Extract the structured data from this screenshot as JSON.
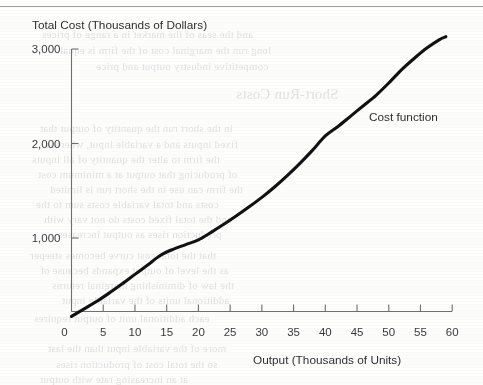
{
  "figure": {
    "background_color": "#fdfdfc",
    "ink_color": "#111114",
    "axis_color": "#6e6e74"
  },
  "bleed_through": [
    {
      "text": "and the seas of the market in a range of prices",
      "x": 42,
      "y": 28,
      "size": 11
    },
    {
      "text": "long run the marginal cost of the firm is equal",
      "x": 60,
      "y": 44,
      "size": 11
    },
    {
      "text": "competitive industry output and price",
      "x": 96,
      "y": 60,
      "size": 11
    },
    {
      "text": "Short-Run Costs",
      "x": 236,
      "y": 86,
      "size": 15
    },
    {
      "text": "in the short run the quantity of output that",
      "x": 40,
      "y": 122,
      "size": 11
    },
    {
      "text": "fixed inputs and a variable input, whereas",
      "x": 46,
      "y": 138,
      "size": 11
    },
    {
      "text": "the firm to alter the quantity of all inputs",
      "x": 32,
      "y": 153,
      "size": 11
    },
    {
      "text": "of producing that output at a minimum cost",
      "x": 38,
      "y": 168,
      "size": 11
    },
    {
      "text": "the firm can use in the short run is limited",
      "x": 50,
      "y": 183,
      "size": 11
    },
    {
      "text": "costs and total variable costs sum to the",
      "x": 36,
      "y": 198,
      "size": 11
    },
    {
      "text": "and the total fixed costs do not vary with",
      "x": 44,
      "y": 213,
      "size": 11
    },
    {
      "text": "production rises as output increases",
      "x": 58,
      "y": 228,
      "size": 11
    },
    {
      "text": "that the total cost curve becomes steeper",
      "x": 30,
      "y": 249,
      "size": 11
    },
    {
      "text": "as the level of output expands because of",
      "x": 40,
      "y": 264,
      "size": 11
    },
    {
      "text": "the law of diminishing marginal returns",
      "x": 52,
      "y": 279,
      "size": 11
    },
    {
      "text": "additional units of the variable input",
      "x": 62,
      "y": 294,
      "size": 11
    },
    {
      "text": "each additional unit of output requires",
      "x": 34,
      "y": 312,
      "size": 11
    },
    {
      "text": "more of the variable input than the last",
      "x": 48,
      "y": 342,
      "size": 11
    },
    {
      "text": "so the total cost of production rises",
      "x": 56,
      "y": 358,
      "size": 11
    },
    {
      "text": "at an increasing rate with output",
      "x": 40,
      "y": 373,
      "size": 11
    }
  ],
  "chart_data": {
    "type": "line",
    "title": "",
    "xlabel": "Output (Thousands of Units)",
    "ylabel": "Total Cost (Thousands of Dollars)",
    "xlim": [
      0,
      60
    ],
    "ylim": [
      0,
      3200
    ],
    "grid": false,
    "legend_position": "inline-annotation",
    "x_ticks": [
      0,
      5,
      10,
      15,
      20,
      25,
      30,
      35,
      40,
      45,
      50,
      55,
      60
    ],
    "x_tick_labels": [
      "0",
      "5",
      "10",
      "15",
      "20",
      "25",
      "30",
      "35",
      "40",
      "45",
      "50",
      "55",
      "60"
    ],
    "y_ticks": [
      1000,
      2000,
      3000
    ],
    "y_tick_labels": [
      "1,000",
      "2,000",
      "3,000"
    ],
    "annotations": [
      {
        "text": "Cost function",
        "x": 45,
        "y": 2180
      }
    ],
    "series": [
      {
        "name": "Cost function",
        "color": "#111114",
        "x": [
          0,
          2,
          4,
          6,
          8,
          10,
          12,
          14,
          16,
          18,
          20,
          22,
          24,
          26,
          28,
          30,
          32,
          34,
          36,
          38,
          40,
          42,
          44,
          46,
          48,
          50,
          52,
          54,
          56,
          58,
          59
        ],
        "values": [
          170,
          250,
          330,
          420,
          515,
          615,
          715,
          815,
          880,
          930,
          980,
          1060,
          1145,
          1235,
          1330,
          1430,
          1540,
          1660,
          1790,
          1930,
          2080,
          2180,
          2290,
          2400,
          2510,
          2640,
          2780,
          2900,
          3010,
          3100,
          3130
        ]
      }
    ]
  }
}
